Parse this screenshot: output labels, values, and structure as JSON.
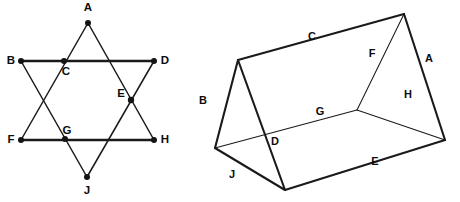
{
  "image": {
    "title": "Two geometry figures: a six-pointed star and a triangular prism",
    "width": 460,
    "height": 202,
    "background_color": "#ffffff",
    "line_color": "#1a1a1a"
  },
  "star_figure": {
    "name": "six-pointed-star",
    "description": "Hexagram formed by two overlapping equilateral triangles with labeled vertices and intersection points",
    "vertices": [
      {
        "label": "A",
        "x": 88,
        "y": 23,
        "dot": true,
        "label_x": 88,
        "label_y": 11,
        "role": "outer-point-top"
      },
      {
        "label": "B",
        "x": 21,
        "y": 61,
        "dot": true,
        "label_x": 11,
        "label_y": 64,
        "role": "outer-point-upper-left"
      },
      {
        "label": "C",
        "x": 64,
        "y": 61,
        "dot": true,
        "label_x": 66,
        "label_y": 75,
        "role": "intersection-upper-left"
      },
      {
        "label": "D",
        "x": 154,
        "y": 61,
        "dot": true,
        "label_x": 165,
        "label_y": 64,
        "role": "outer-point-upper-right"
      },
      {
        "label": "E",
        "x": 131,
        "y": 100,
        "dot": true,
        "label_x": 121,
        "label_y": 97,
        "role": "intersection-right"
      },
      {
        "label": "F",
        "x": 21,
        "y": 140,
        "dot": true,
        "label_x": 11,
        "label_y": 143,
        "role": "outer-point-lower-left"
      },
      {
        "label": "G",
        "x": 65,
        "y": 139,
        "dot": true,
        "label_x": 67,
        "label_y": 134,
        "role": "intersection-lower-left"
      },
      {
        "label": "H",
        "x": 154,
        "y": 140,
        "dot": true,
        "label_x": 165,
        "label_y": 143,
        "role": "outer-point-lower-right"
      },
      {
        "label": "J",
        "x": 87,
        "y": 177,
        "dot": true,
        "label_x": 87,
        "label_y": 194,
        "role": "outer-point-bottom"
      }
    ],
    "triangle_up": {
      "points": "88,23 154,140 21,140",
      "note": "apex A, base F-H"
    },
    "triangle_down": {
      "points": "21,61 154,61 87,177",
      "note": "apex J, base B-D"
    },
    "heavy_bars": [
      {
        "from": "B",
        "to": "D",
        "x1": 21,
        "y1": 61,
        "x2": 154,
        "y2": 61
      },
      {
        "from": "F",
        "to": "H",
        "x1": 21,
        "y1": 140,
        "x2": 154,
        "y2": 140
      }
    ]
  },
  "prism_figure": {
    "name": "triangular-prism",
    "description": "Triangular prism (tent shape) drawn in oblique projection with nine labeled edges",
    "vertices": {
      "ridge_back": {
        "x": 238,
        "y": 60,
        "name": "ridge-left"
      },
      "ridge_front": {
        "x": 404,
        "y": 14,
        "name": "ridge-right"
      },
      "base_back_left": {
        "x": 215,
        "y": 148,
        "name": "base-far-left"
      },
      "base_front_left": {
        "x": 285,
        "y": 190,
        "name": "base-near-left"
      },
      "base_inner": {
        "x": 357,
        "y": 110,
        "name": "base-inner-hidden"
      },
      "base_right": {
        "x": 445,
        "y": 140,
        "name": "base-right"
      }
    },
    "edges": [
      {
        "label": "C",
        "label_x": 312,
        "label_y": 40,
        "style": "bold",
        "x1": 238,
        "y1": 60,
        "x2": 404,
        "y2": 14,
        "name": "top-ridge"
      },
      {
        "label": "A",
        "label_x": 429,
        "label_y": 62,
        "style": "bold",
        "x1": 404,
        "y1": 14,
        "x2": 445,
        "y2": 140,
        "name": "right-slant-front"
      },
      {
        "label": "F",
        "label_x": 372,
        "label_y": 57,
        "style": "thin",
        "x1": 404,
        "y1": 14,
        "x2": 357,
        "y2": 110,
        "name": "right-slant-back"
      },
      {
        "label": "H",
        "label_x": 408,
        "label_y": 98,
        "style": "thin",
        "x1": 357,
        "y1": 110,
        "x2": 445,
        "y2": 140,
        "name": "right-base-back"
      },
      {
        "label": "B",
        "label_x": 203,
        "label_y": 104,
        "style": "bold",
        "x1": 238,
        "y1": 60,
        "x2": 215,
        "y2": 148,
        "name": "left-slant-back"
      },
      {
        "label": "D",
        "label_x": 275,
        "label_y": 145,
        "style": "bold",
        "x1": 238,
        "y1": 60,
        "x2": 285,
        "y2": 190,
        "name": "left-slant-front"
      },
      {
        "label": "G",
        "label_x": 320,
        "label_y": 115,
        "style": "thin",
        "x1": 215,
        "y1": 148,
        "x2": 357,
        "y2": 110,
        "name": "base-back-long"
      },
      {
        "label": "J",
        "label_x": 232,
        "label_y": 178,
        "style": "bold",
        "x1": 215,
        "y1": 148,
        "x2": 285,
        "y2": 190,
        "name": "base-left-front"
      },
      {
        "label": "E",
        "label_x": 375,
        "label_y": 165,
        "style": "bold",
        "x1": 285,
        "y1": 190,
        "x2": 445,
        "y2": 140,
        "name": "base-front-long"
      }
    ]
  }
}
